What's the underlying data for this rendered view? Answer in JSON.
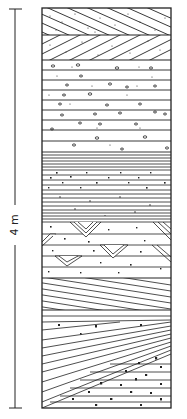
{
  "figure": {
    "type": "stratigraphic-column",
    "scale_bar": {
      "label": "4 m",
      "top_y": 9,
      "bottom_y": 408,
      "x": 15
    },
    "column": {
      "left": 42,
      "right": 171,
      "top": 8,
      "bottom": 408
    },
    "colors": {
      "line": "#222222",
      "background": "#ffffff"
    },
    "layers": [
      {
        "name": "cross-bedded-sandstone-dipping-right",
        "top": 8,
        "bottom": 35
      },
      {
        "name": "cross-bedded-sandstone-dipping-left",
        "top": 35,
        "bottom": 60
      },
      {
        "name": "laminated-sandstone-with-pebbles",
        "top": 60,
        "bottom": 152
      },
      {
        "name": "fine-laminated-silt",
        "top": 152,
        "bottom": 170
      },
      {
        "name": "sand-with-grains",
        "top": 170,
        "bottom": 190
      },
      {
        "name": "fine-laminated-silt-2",
        "top": 190,
        "bottom": 222
      },
      {
        "name": "sandstone-with-trough-cross-bedding",
        "top": 222,
        "bottom": 278
      },
      {
        "name": "low-angle-cross-bedded-sandstone",
        "top": 278,
        "bottom": 310
      },
      {
        "name": "wedge-cross-bedded-conglomeratic-sandstone",
        "top": 310,
        "bottom": 408
      }
    ]
  }
}
